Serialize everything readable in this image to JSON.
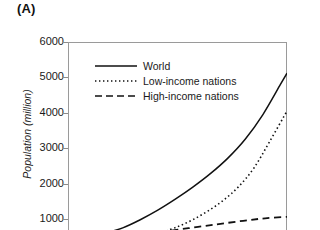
{
  "panel": {
    "label": "(A)"
  },
  "chart_data": {
    "type": "line",
    "title": "",
    "xlabel": "",
    "ylabel": "Population (million)",
    "ylim": [
      0,
      6000
    ],
    "yticks": [
      6000,
      5000,
      4000,
      3000,
      2000,
      1000
    ],
    "ytick_labels": [
      "6000",
      "5000",
      "4000",
      "3000",
      "2000",
      "1000"
    ],
    "grid": false,
    "legend_position": "upper-left-inside",
    "note": "x-axis is cropped off the bottom of this screenshot; no x tick labels are visible",
    "series": [
      {
        "name": "World",
        "style": "solid",
        "color": "#111111",
        "x": [
          0.17,
          0.25,
          0.33,
          0.41,
          0.49,
          0.57,
          0.65,
          0.73,
          0.81,
          0.89,
          0.97,
          1.0
        ],
        "values": [
          600,
          750,
          980,
          1250,
          1560,
          1900,
          2280,
          2720,
          3260,
          3950,
          4800,
          5120
        ]
      },
      {
        "name": "Low-income nations",
        "style": "dotted",
        "color": "#111111",
        "x": [
          0.43,
          0.5,
          0.57,
          0.64,
          0.71,
          0.78,
          0.85,
          0.92,
          1.0
        ],
        "values": [
          620,
          780,
          980,
          1230,
          1530,
          1920,
          2450,
          3180,
          4050
        ]
      },
      {
        "name": "High-income nations",
        "style": "dashed",
        "color": "#111111",
        "x": [
          0.42,
          0.55,
          0.68,
          0.8,
          0.9,
          1.0
        ],
        "values": [
          630,
          740,
          850,
          950,
          1020,
          1060
        ]
      }
    ]
  },
  "legend": {
    "items": [
      {
        "label": "World",
        "sample": "solid-line-sample"
      },
      {
        "label": "Low-income nations",
        "sample": "dotted-line-sample"
      },
      {
        "label": "High-income nations",
        "sample": "dashed-line-sample"
      }
    ]
  }
}
